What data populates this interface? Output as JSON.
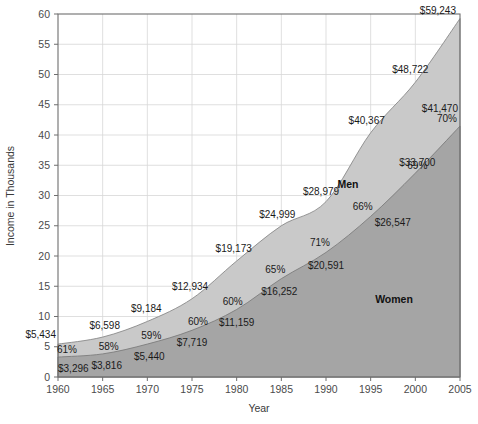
{
  "chart_data": {
    "type": "area",
    "title": "",
    "xlabel": "Year",
    "ylabel": "Income in Thousands",
    "categories": [
      1960,
      1965,
      1970,
      1975,
      1980,
      1985,
      1990,
      1995,
      2000,
      2005
    ],
    "x": [
      1960,
      1965,
      1970,
      1975,
      1980,
      1985,
      1990,
      1995,
      2000,
      2005
    ],
    "xlim": [
      1960,
      2005
    ],
    "ylim": [
      0,
      60
    ],
    "xticks": [
      "1960",
      "1965",
      "1970",
      "1975",
      "1980",
      "1985",
      "1990",
      "1995",
      "2000",
      "2005"
    ],
    "yticks": [
      "0",
      "5",
      "10",
      "15",
      "20",
      "25",
      "30",
      "35",
      "40",
      "45",
      "50",
      "55",
      "60"
    ],
    "grid": true,
    "legend": "inline-labels",
    "stacked": true,
    "series": [
      {
        "name": "Men",
        "color": "#c9c9c9",
        "values": [
          5434,
          6598,
          9184,
          12934,
          19173,
          24999,
          28979,
          40367,
          48722,
          59243
        ],
        "value_labels": [
          "$5,434",
          "$6,598",
          "$9,184",
          "$12,934",
          "$19,173",
          "$24,999",
          "$28,979",
          "$40,367",
          "$48,722",
          "$59,243"
        ]
      },
      {
        "name": "Women",
        "color": "#a5a5a5",
        "values": [
          3296,
          3816,
          5440,
          7719,
          11159,
          16252,
          20591,
          26547,
          33700,
          41470
        ],
        "value_labels": [
          "$3,296",
          "$3,816",
          "$5,440",
          "$7,719",
          "$11,159",
          "$16,252",
          "$20,591",
          "$26,547",
          "$33,700",
          "$41,470"
        ]
      }
    ],
    "ratio_labels": [
      "61%",
      "58%",
      "59%",
      "60%",
      "60%",
      "65%",
      "71%",
      "66%",
      "69%",
      "70%"
    ],
    "annotations": {
      "men_area_label": "Men",
      "women_area_label": "Women"
    }
  },
  "axes": {
    "y_title": "Income in Thousands",
    "x_title": "Year"
  }
}
